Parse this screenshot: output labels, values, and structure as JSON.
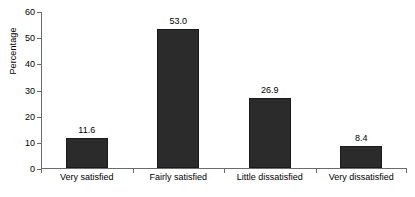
{
  "chart_data": {
    "type": "bar",
    "title": "",
    "subtitle": "",
    "xlabel": "",
    "ylabel": "Percentage",
    "categories": [
      "Very satisfied",
      "Fairly satisfied",
      "Little dissatisfied",
      "Very dissatisfied"
    ],
    "values": [
      11.6,
      53.0,
      26.9,
      8.4
    ],
    "value_labels": [
      "11.6",
      "53.0",
      "26.9",
      "8.4"
    ],
    "ylim": [
      0,
      60
    ],
    "ytick_values": [
      0,
      10,
      20,
      30,
      40,
      50,
      60
    ],
    "ytick_labels": [
      "0",
      "10",
      "20",
      "30",
      "40",
      "50",
      "60"
    ],
    "grid": false,
    "legend": false,
    "legend_position": "none",
    "bar_color": "#2b2b2b",
    "axis_color": "#6b6b6b",
    "background_color": "#ffffff",
    "data_labels_shown": true
  }
}
